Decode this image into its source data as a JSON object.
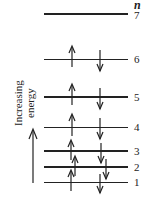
{
  "header": {
    "n_label": "n"
  },
  "axis": {
    "label_line1": "Increasing",
    "label_line2": "energy"
  },
  "levels": [
    {
      "n": "7",
      "y": 14,
      "thick": true,
      "up": false,
      "down": false
    },
    {
      "n": "6",
      "y": 59,
      "thick": false,
      "up": true,
      "down": true
    },
    {
      "n": "5",
      "y": 97,
      "thick": true,
      "up": true,
      "down": true
    },
    {
      "n": "4",
      "y": 127,
      "thick": false,
      "up": true,
      "down": true
    },
    {
      "n": "3",
      "y": 151,
      "thick": true,
      "up": true,
      "down": true
    },
    {
      "n": "2",
      "y": 167,
      "thick": true,
      "up": true,
      "down": true
    },
    {
      "n": "1",
      "y": 182,
      "thick": false,
      "up": true,
      "down": true
    }
  ],
  "colors": {
    "line": "#222222",
    "background": "#ffffff"
  }
}
